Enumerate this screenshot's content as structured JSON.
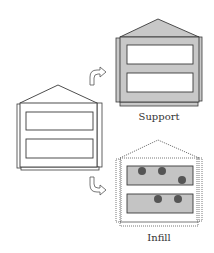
{
  "diagram": {
    "labels": {
      "support": "Support",
      "infill": "Infill"
    },
    "nodes": [
      {
        "id": "whole-building",
        "description": "building outline with two window bands"
      },
      {
        "id": "support",
        "description": "gray structure shell with white openings",
        "label": "Support"
      },
      {
        "id": "infill",
        "description": "dotted shell with gray bands containing dots",
        "label": "Infill"
      }
    ],
    "edges": [
      {
        "from": "whole-building",
        "to": "support",
        "icon": "curved-arrow-up-right-icon"
      },
      {
        "from": "whole-building",
        "to": "infill",
        "icon": "curved-arrow-down-right-icon"
      }
    ],
    "colors": {
      "stroke": "#3a3a3a",
      "support_fill": "#c8c8c8",
      "infill_band_fill": "#c4c4c4",
      "dot_fill": "#555555",
      "background": "#ffffff"
    }
  }
}
